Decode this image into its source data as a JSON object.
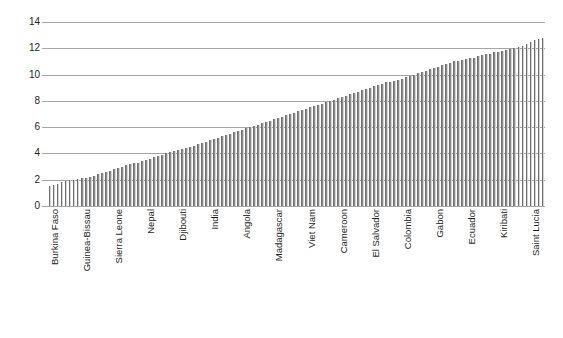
{
  "chart_data": {
    "type": "bar",
    "title": "",
    "subtitle": "",
    "xlabel": "",
    "ylabel": "",
    "ylim": [
      0,
      14
    ],
    "ytick_values": [
      0,
      2,
      4,
      6,
      8,
      10,
      12,
      14
    ],
    "ytick_labels": [
      "0",
      "2",
      "4",
      "6",
      "8",
      "10",
      "12",
      "14"
    ],
    "grid": true,
    "legend": false,
    "legend_position": "none",
    "orientation": "vertical",
    "sorted": "ascending",
    "bar_color": "#8d8d8d",
    "gridline_color": "#a6a6a6",
    "n_bars": 124,
    "labeled_tick_interval": 8,
    "categories": [
      "Burkina Faso",
      "",
      "",
      "",
      "",
      "",
      "",
      "",
      "Guinea-Bissau",
      "",
      "",
      "",
      "",
      "",
      "",
      "",
      "Sierra Leone",
      "",
      "",
      "",
      "",
      "",
      "",
      "",
      "Nepal",
      "",
      "",
      "",
      "",
      "",
      "",
      "",
      "Djibouti",
      "",
      "",
      "",
      "",
      "",
      "",
      "",
      "India",
      "",
      "",
      "",
      "",
      "",
      "",
      "",
      "Angola",
      "",
      "",
      "",
      "",
      "",
      "",
      "",
      "Madagascar",
      "",
      "",
      "",
      "",
      "",
      "",
      "",
      "Viet Nam",
      "",
      "",
      "",
      "",
      "",
      "",
      "",
      "Cameroon",
      "",
      "",
      "",
      "",
      "",
      "",
      "",
      "El Salvador",
      "",
      "",
      "",
      "",
      "",
      "",
      "",
      "Colombia",
      "",
      "",
      "",
      "",
      "",
      "",
      "",
      "Gabon",
      "",
      "",
      "",
      "",
      "",
      "",
      "",
      "Ecuador",
      "",
      "",
      "",
      "",
      "",
      "",
      "",
      "Kiribati",
      "",
      "",
      "",
      "",
      "",
      "",
      "",
      "Saint Lucia",
      "",
      "",
      ""
    ],
    "labeled_categories": [
      "Burkina Faso",
      "Guinea-Bissau",
      "Sierra Leone",
      "Nepal",
      "Djibouti",
      "India",
      "Angola",
      "Madagascar",
      "Viet Nam",
      "Cameroon",
      "El Salvador",
      "Colombia",
      "Gabon",
      "Ecuador",
      "Kiribati",
      "Saint Lucia",
      "Uruguay",
      "Botswana",
      "Vanuatu",
      "Kyrgyzstan",
      "Malaysia",
      "Moldova (Republic of)",
      "Turkmenistan",
      "Singapore",
      "Kazakhstan",
      "Sri Lanka",
      "Azerbaijan",
      "Latvia",
      "Korea (Republic of)",
      "Georgia",
      "Lithuania",
      "United States"
    ],
    "values": [
      1.5,
      1.6,
      1.7,
      1.8,
      1.9,
      1.95,
      2.0,
      2.05,
      2.1,
      2.15,
      2.2,
      2.3,
      2.4,
      2.5,
      2.6,
      2.7,
      2.8,
      2.9,
      3.0,
      3.1,
      3.2,
      3.25,
      3.3,
      3.4,
      3.5,
      3.6,
      3.7,
      3.8,
      3.9,
      4.0,
      4.1,
      4.2,
      4.3,
      4.35,
      4.4,
      4.5,
      4.6,
      4.7,
      4.8,
      4.9,
      5.0,
      5.1,
      5.2,
      5.3,
      5.4,
      5.5,
      5.6,
      5.7,
      5.8,
      5.9,
      6.0,
      6.1,
      6.2,
      6.3,
      6.4,
      6.5,
      6.6,
      6.7,
      6.8,
      6.9,
      7.0,
      7.1,
      7.2,
      7.3,
      7.4,
      7.5,
      7.6,
      7.7,
      7.8,
      7.9,
      8.0,
      8.1,
      8.2,
      8.3,
      8.4,
      8.5,
      8.6,
      8.7,
      8.8,
      8.9,
      9.0,
      9.1,
      9.2,
      9.3,
      9.4,
      9.45,
      9.5,
      9.6,
      9.7,
      9.8,
      9.9,
      10.0,
      10.1,
      10.2,
      10.3,
      10.4,
      10.5,
      10.6,
      10.7,
      10.8,
      10.9,
      11.0,
      11.05,
      11.1,
      11.2,
      11.25,
      11.3,
      11.4,
      11.5,
      11.55,
      11.6,
      11.7,
      11.75,
      11.8,
      11.9,
      11.95,
      12.0,
      12.1,
      12.2,
      12.35,
      12.5,
      12.6,
      12.7,
      12.8
    ]
  }
}
